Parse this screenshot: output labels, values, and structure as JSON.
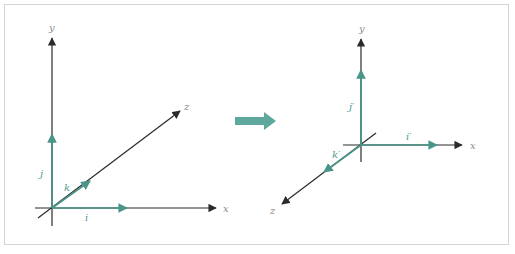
{
  "figure": {
    "colors": {
      "axis": "#2b2b2b",
      "vector": "#4a9489",
      "transform_arrow": "#5fa89d",
      "label": "#8a8a8a",
      "border": "#d4d4d4"
    },
    "left_panel": {
      "axes": {
        "x": "x",
        "y": "y",
        "z": "z"
      },
      "vectors": {
        "i": "i",
        "j": "j",
        "k": "k"
      }
    },
    "transform_arrow": {
      "icon": "right-arrow-icon"
    },
    "right_panel": {
      "axes": {
        "x": "x",
        "y": "y",
        "z": "z"
      },
      "vectors": {
        "i": "i′",
        "j": "j′",
        "k": "k′"
      }
    }
  }
}
